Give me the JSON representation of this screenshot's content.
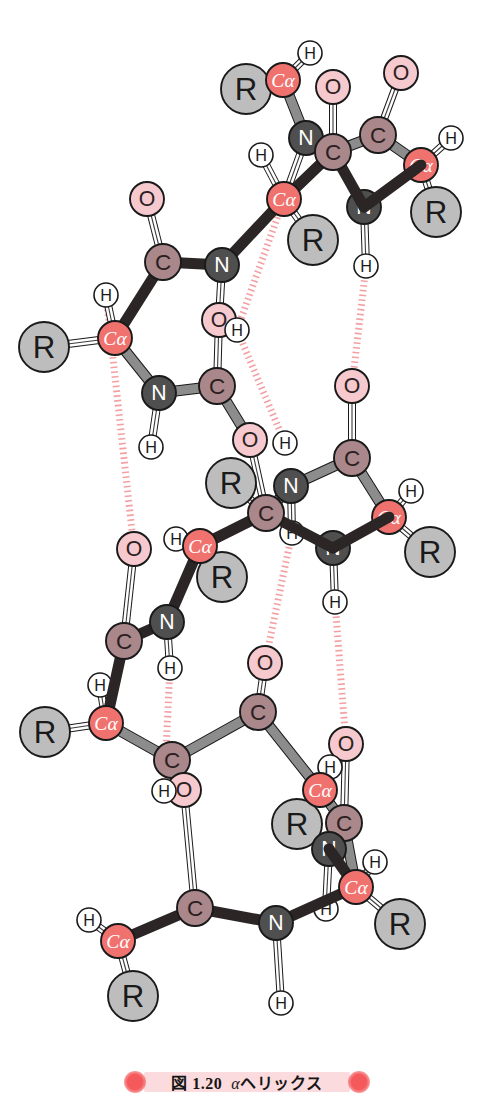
{
  "figure": {
    "caption_number": "図 1.20",
    "caption_alpha": "α",
    "caption_title": "ヘリックス",
    "caption_full": "図 1.20  αヘリックス",
    "background_color": "#ffffff"
  },
  "legend_colors": {
    "c_alpha": "#f0726f",
    "c_alpha_text": "#ffffff",
    "carbon": "#a9878a",
    "carbon_text": "#2b2020",
    "nitrogen": "#4f4f4f",
    "nitrogen_text": "#ffffff",
    "oxygen": "#f5c9cd",
    "oxygen_text": "#2b2020",
    "r_group": "#bdbdbd",
    "r_group_text": "#1a1a1a",
    "hydrogen": "#ffffff",
    "hydrogen_text": "#1a1a1a",
    "bond_front": "#2b2526",
    "bond_back": "#8c8c8c",
    "bond_double": "#ffffff",
    "hbond": "#f4a0a3",
    "outline": "#1a1a1a"
  },
  "atom_labels": {
    "c_alpha": "Cα",
    "carbon": "C",
    "nitrogen": "N",
    "oxygen": "O",
    "r_group": "R",
    "hydrogen": "H"
  },
  "atoms": [
    {
      "id": "a1",
      "label": "R",
      "kind": "r",
      "x": 246,
      "y": 89,
      "r": 25,
      "depth": 1
    },
    {
      "id": "a2",
      "label": "Cα",
      "kind": "ca",
      "x": 283,
      "y": 80,
      "r": 17,
      "depth": 2
    },
    {
      "id": "a3",
      "label": "H",
      "kind": "h",
      "x": 310,
      "y": 53,
      "r": 12,
      "depth": 1
    },
    {
      "id": "a4",
      "label": "O",
      "kind": "o",
      "x": 333,
      "y": 87,
      "r": 17,
      "depth": 1
    },
    {
      "id": "a5",
      "label": "O",
      "kind": "o",
      "x": 401,
      "y": 73,
      "r": 17,
      "depth": 1
    },
    {
      "id": "a6",
      "label": "N",
      "kind": "n",
      "x": 306,
      "y": 138,
      "r": 17,
      "depth": 1
    },
    {
      "id": "a7",
      "label": "C",
      "kind": "c",
      "x": 333,
      "y": 152,
      "r": 18,
      "depth": 2
    },
    {
      "id": "a8",
      "label": "C",
      "kind": "c",
      "x": 378,
      "y": 135,
      "r": 18,
      "depth": 1
    },
    {
      "id": "a9",
      "label": "H",
      "kind": "h",
      "x": 451,
      "y": 138,
      "r": 12,
      "depth": 1
    },
    {
      "id": "a10",
      "label": "Cα",
      "kind": "ca",
      "x": 421,
      "y": 165,
      "r": 17,
      "depth": 1
    },
    {
      "id": "a11",
      "label": "R",
      "kind": "r",
      "x": 436,
      "y": 212,
      "r": 25,
      "depth": 1
    },
    {
      "id": "a12",
      "label": "H",
      "kind": "h",
      "x": 261,
      "y": 155,
      "r": 12,
      "depth": 1
    },
    {
      "id": "a13",
      "label": "Cα",
      "kind": "ca",
      "x": 284,
      "y": 199,
      "r": 17,
      "depth": 2
    },
    {
      "id": "a14",
      "label": "R",
      "kind": "r",
      "x": 313,
      "y": 240,
      "r": 25,
      "depth": 1
    },
    {
      "id": "a15",
      "label": "N",
      "kind": "n",
      "x": 364,
      "y": 207,
      "r": 17,
      "depth": 1
    },
    {
      "id": "a16",
      "label": "H",
      "kind": "h",
      "x": 366,
      "y": 266,
      "r": 12,
      "depth": 1
    },
    {
      "id": "a17",
      "label": "O",
      "kind": "o",
      "x": 147,
      "y": 199,
      "r": 17,
      "depth": 1
    },
    {
      "id": "a18",
      "label": "C",
      "kind": "c",
      "x": 163,
      "y": 262,
      "r": 18,
      "depth": 2
    },
    {
      "id": "a19",
      "label": "N",
      "kind": "n",
      "x": 222,
      "y": 265,
      "r": 17,
      "depth": 2
    },
    {
      "id": "a20",
      "label": "H",
      "kind": "h",
      "x": 106,
      "y": 295,
      "r": 12,
      "depth": 1
    },
    {
      "id": "a21",
      "label": "Cα",
      "kind": "ca",
      "x": 115,
      "y": 338,
      "r": 17,
      "depth": 2
    },
    {
      "id": "a22",
      "label": "R",
      "kind": "r",
      "x": 44,
      "y": 347,
      "r": 25,
      "depth": 1
    },
    {
      "id": "a23",
      "label": "N",
      "kind": "n",
      "x": 159,
      "y": 393,
      "r": 17,
      "depth": 1
    },
    {
      "id": "a24",
      "label": "H",
      "kind": "h",
      "x": 151,
      "y": 447,
      "r": 12,
      "depth": 1
    },
    {
      "id": "a25",
      "label": "O",
      "kind": "o",
      "x": 219,
      "y": 320,
      "r": 17,
      "depth": 1
    },
    {
      "id": "a26",
      "label": "H",
      "kind": "h",
      "x": 237,
      "y": 330,
      "r": 12,
      "depth": 1
    },
    {
      "id": "a27",
      "label": "C",
      "kind": "c",
      "x": 217,
      "y": 386,
      "r": 18,
      "depth": 1
    },
    {
      "id": "a28",
      "label": "O",
      "kind": "o",
      "x": 250,
      "y": 440,
      "r": 17,
      "depth": 1
    },
    {
      "id": "a29",
      "label": "H",
      "kind": "h",
      "x": 285,
      "y": 443,
      "r": 12,
      "depth": 1
    },
    {
      "id": "a30",
      "label": "O",
      "kind": "o",
      "x": 352,
      "y": 386,
      "r": 17,
      "depth": 1
    },
    {
      "id": "a31",
      "label": "R",
      "kind": "r",
      "x": 231,
      "y": 483,
      "r": 25,
      "depth": 1
    },
    {
      "id": "a32",
      "label": "C",
      "kind": "c",
      "x": 266,
      "y": 513,
      "r": 18,
      "depth": 2
    },
    {
      "id": "a33",
      "label": "N",
      "kind": "n",
      "x": 291,
      "y": 486,
      "r": 17,
      "depth": 1
    },
    {
      "id": "a34",
      "label": "H",
      "kind": "h",
      "x": 292,
      "y": 533,
      "r": 12,
      "depth": 1
    },
    {
      "id": "a35",
      "label": "C",
      "kind": "c",
      "x": 352,
      "y": 458,
      "r": 18,
      "depth": 1
    },
    {
      "id": "a36",
      "label": "H",
      "kind": "h",
      "x": 411,
      "y": 491,
      "r": 12,
      "depth": 1
    },
    {
      "id": "a37",
      "label": "Cα",
      "kind": "ca",
      "x": 389,
      "y": 517,
      "r": 17,
      "depth": 1
    },
    {
      "id": "a38",
      "label": "R",
      "kind": "r",
      "x": 430,
      "y": 552,
      "r": 25,
      "depth": 1
    },
    {
      "id": "a39",
      "label": "N",
      "kind": "n",
      "x": 333,
      "y": 548,
      "r": 17,
      "depth": 1
    },
    {
      "id": "a40",
      "label": "H",
      "kind": "h",
      "x": 335,
      "y": 602,
      "r": 12,
      "depth": 1
    },
    {
      "id": "a41",
      "label": "H",
      "kind": "h",
      "x": 176,
      "y": 539,
      "r": 12,
      "depth": 1
    },
    {
      "id": "a42",
      "label": "Cα",
      "kind": "ca",
      "x": 200,
      "y": 546,
      "r": 17,
      "depth": 2
    },
    {
      "id": "a43",
      "label": "R",
      "kind": "r",
      "x": 222,
      "y": 577,
      "r": 25,
      "depth": 1
    },
    {
      "id": "a44",
      "label": "O",
      "kind": "o",
      "x": 134,
      "y": 549,
      "r": 17,
      "depth": 1
    },
    {
      "id": "a45",
      "label": "N",
      "kind": "n",
      "x": 167,
      "y": 622,
      "r": 17,
      "depth": 2
    },
    {
      "id": "a46",
      "label": "H",
      "kind": "h",
      "x": 170,
      "y": 668,
      "r": 12,
      "depth": 1
    },
    {
      "id": "a47",
      "label": "C",
      "kind": "c",
      "x": 124,
      "y": 641,
      "r": 18,
      "depth": 2
    },
    {
      "id": "a48",
      "label": "H",
      "kind": "h",
      "x": 100,
      "y": 685,
      "r": 12,
      "depth": 1
    },
    {
      "id": "a49",
      "label": "Cα",
      "kind": "ca",
      "x": 106,
      "y": 723,
      "r": 17,
      "depth": 2
    },
    {
      "id": "a50",
      "label": "R",
      "kind": "r",
      "x": 45,
      "y": 732,
      "r": 25,
      "depth": 1
    },
    {
      "id": "a51",
      "label": "C",
      "kind": "c",
      "x": 172,
      "y": 760,
      "r": 18,
      "depth": 1
    },
    {
      "id": "a52",
      "label": "O",
      "kind": "o",
      "x": 265,
      "y": 663,
      "r": 17,
      "depth": 1
    },
    {
      "id": "a53",
      "label": "C",
      "kind": "c",
      "x": 258,
      "y": 712,
      "r": 18,
      "depth": 1
    },
    {
      "id": "a54",
      "label": "O",
      "kind": "o",
      "x": 184,
      "y": 790,
      "r": 17,
      "depth": 1
    },
    {
      "id": "a55",
      "label": "H",
      "kind": "h",
      "x": 164,
      "y": 791,
      "r": 12,
      "depth": 1
    },
    {
      "id": "a56",
      "label": "O",
      "kind": "o",
      "x": 346,
      "y": 744,
      "r": 17,
      "depth": 1
    },
    {
      "id": "a57",
      "label": "H",
      "kind": "h",
      "x": 330,
      "y": 767,
      "r": 12,
      "depth": 1
    },
    {
      "id": "a58",
      "label": "Cα",
      "kind": "ca",
      "x": 320,
      "y": 790,
      "r": 17,
      "depth": 2
    },
    {
      "id": "a59",
      "label": "R",
      "kind": "r",
      "x": 297,
      "y": 824,
      "r": 25,
      "depth": 1
    },
    {
      "id": "a60",
      "label": "C",
      "kind": "c",
      "x": 344,
      "y": 823,
      "r": 18,
      "depth": 1
    },
    {
      "id": "a61",
      "label": "N",
      "kind": "n",
      "x": 329,
      "y": 849,
      "r": 17,
      "depth": 1
    },
    {
      "id": "a62",
      "label": "H",
      "kind": "h",
      "x": 375,
      "y": 862,
      "r": 12,
      "depth": 1
    },
    {
      "id": "a63",
      "label": "Cα",
      "kind": "ca",
      "x": 356,
      "y": 887,
      "r": 17,
      "depth": 2
    },
    {
      "id": "a64",
      "label": "R",
      "kind": "r",
      "x": 400,
      "y": 924,
      "r": 25,
      "depth": 1
    },
    {
      "id": "a65",
      "label": "H",
      "kind": "h",
      "x": 326,
      "y": 909,
      "r": 12,
      "depth": 1
    },
    {
      "id": "a66",
      "label": "C",
      "kind": "c",
      "x": 195,
      "y": 908,
      "r": 18,
      "depth": 2
    },
    {
      "id": "a67",
      "label": "N",
      "kind": "n",
      "x": 276,
      "y": 923,
      "r": 17,
      "depth": 2
    },
    {
      "id": "a68",
      "label": "H",
      "kind": "h",
      "x": 281,
      "y": 1003,
      "r": 12,
      "depth": 1
    },
    {
      "id": "a69",
      "label": "H",
      "kind": "h",
      "x": 89,
      "y": 920,
      "r": 12,
      "depth": 1
    },
    {
      "id": "a70",
      "label": "Cα",
      "kind": "ca",
      "x": 118,
      "y": 941,
      "r": 17,
      "depth": 2
    },
    {
      "id": "a71",
      "label": "R",
      "kind": "r",
      "x": 133,
      "y": 996,
      "r": 25,
      "depth": 1
    }
  ],
  "bonds": [
    {
      "from": "a1",
      "to": "a2",
      "style": "double"
    },
    {
      "from": "a2",
      "to": "a3",
      "style": "double"
    },
    {
      "from": "a2",
      "to": "a6",
      "style": "back"
    },
    {
      "from": "a6",
      "to": "a7",
      "style": "back"
    },
    {
      "from": "a4",
      "to": "a7",
      "style": "double"
    },
    {
      "from": "a7",
      "to": "a8",
      "style": "back"
    },
    {
      "from": "a5",
      "to": "a8",
      "style": "double"
    },
    {
      "from": "a8",
      "to": "a10",
      "style": "back"
    },
    {
      "from": "a10",
      "to": "a9",
      "style": "double"
    },
    {
      "from": "a10",
      "to": "a11",
      "style": "double"
    },
    {
      "from": "a10",
      "to": "a15",
      "style": "front"
    },
    {
      "from": "a15",
      "to": "a7",
      "style": "front"
    },
    {
      "from": "a15",
      "to": "a16",
      "style": "double"
    },
    {
      "from": "a7",
      "to": "a13",
      "style": "front"
    },
    {
      "from": "a13",
      "to": "a12",
      "style": "double"
    },
    {
      "from": "a13",
      "to": "a6",
      "style": "double"
    },
    {
      "from": "a13",
      "to": "a14",
      "style": "double"
    },
    {
      "from": "a13",
      "to": "a19",
      "style": "front"
    },
    {
      "from": "a19",
      "to": "a18",
      "style": "front"
    },
    {
      "from": "a18",
      "to": "a17",
      "style": "double"
    },
    {
      "from": "a18",
      "to": "a21",
      "style": "front"
    },
    {
      "from": "a21",
      "to": "a20",
      "style": "double"
    },
    {
      "from": "a21",
      "to": "a22",
      "style": "double"
    },
    {
      "from": "a21",
      "to": "a23",
      "style": "back"
    },
    {
      "from": "a23",
      "to": "a24",
      "style": "double"
    },
    {
      "from": "a23",
      "to": "a27",
      "style": "back"
    },
    {
      "from": "a19",
      "to": "a25",
      "style": "double"
    },
    {
      "from": "a27",
      "to": "a25",
      "style": "double"
    },
    {
      "from": "a27",
      "to": "a28",
      "style": "back"
    },
    {
      "from": "a28",
      "to": "a32",
      "style": "double"
    },
    {
      "from": "a32",
      "to": "a31",
      "style": "double"
    },
    {
      "from": "a32",
      "to": "a33",
      "style": "back"
    },
    {
      "from": "a33",
      "to": "a34",
      "style": "double"
    },
    {
      "from": "a33",
      "to": "a35",
      "style": "back"
    },
    {
      "from": "a35",
      "to": "a30",
      "style": "double"
    },
    {
      "from": "a35",
      "to": "a37",
      "style": "back"
    },
    {
      "from": "a37",
      "to": "a36",
      "style": "double"
    },
    {
      "from": "a37",
      "to": "a38",
      "style": "double"
    },
    {
      "from": "a37",
      "to": "a39",
      "style": "front"
    },
    {
      "from": "a39",
      "to": "a32",
      "style": "front"
    },
    {
      "from": "a39",
      "to": "a40",
      "style": "double"
    },
    {
      "from": "a32",
      "to": "a42",
      "style": "front"
    },
    {
      "from": "a42",
      "to": "a41",
      "style": "double"
    },
    {
      "from": "a42",
      "to": "a43",
      "style": "double"
    },
    {
      "from": "a42",
      "to": "a45",
      "style": "front"
    },
    {
      "from": "a45",
      "to": "a46",
      "style": "double"
    },
    {
      "from": "a45",
      "to": "a47",
      "style": "front"
    },
    {
      "from": "a47",
      "to": "a44",
      "style": "double"
    },
    {
      "from": "a47",
      "to": "a49",
      "style": "front"
    },
    {
      "from": "a49",
      "to": "a48",
      "style": "double"
    },
    {
      "from": "a49",
      "to": "a50",
      "style": "double"
    },
    {
      "from": "a49",
      "to": "a51",
      "style": "back"
    },
    {
      "from": "a51",
      "to": "a53",
      "style": "back"
    },
    {
      "from": "a53",
      "to": "a52",
      "style": "double"
    },
    {
      "from": "a53",
      "to": "a58",
      "style": "back"
    },
    {
      "from": "a51",
      "to": "a54",
      "style": "double"
    },
    {
      "from": "a54",
      "to": "a55",
      "style": "double"
    },
    {
      "from": "a54",
      "to": "a66",
      "style": "double"
    },
    {
      "from": "a58",
      "to": "a57",
      "style": "double"
    },
    {
      "from": "a58",
      "to": "a59",
      "style": "double"
    },
    {
      "from": "a58",
      "to": "a60",
      "style": "back"
    },
    {
      "from": "a60",
      "to": "a56",
      "style": "double"
    },
    {
      "from": "a60",
      "to": "a63",
      "style": "back"
    },
    {
      "from": "a61",
      "to": "a63",
      "style": "front"
    },
    {
      "from": "a61",
      "to": "a65",
      "style": "double"
    },
    {
      "from": "a63",
      "to": "a62",
      "style": "double"
    },
    {
      "from": "a63",
      "to": "a64",
      "style": "double"
    },
    {
      "from": "a63",
      "to": "a67",
      "style": "front"
    },
    {
      "from": "a67",
      "to": "a66",
      "style": "front"
    },
    {
      "from": "a67",
      "to": "a68",
      "style": "double"
    },
    {
      "from": "a66",
      "to": "a70",
      "style": "front"
    },
    {
      "from": "a70",
      "to": "a69",
      "style": "double"
    },
    {
      "from": "a70",
      "to": "a71",
      "style": "double"
    }
  ],
  "hydrogen_bonds": [
    {
      "from": "a13",
      "to": "a26"
    },
    {
      "from": "a16",
      "to": "a30"
    },
    {
      "from": "a26",
      "to": "a29"
    },
    {
      "from": "a20",
      "to": "a44"
    },
    {
      "from": "a34",
      "to": "a52"
    },
    {
      "from": "a40",
      "to": "a56"
    },
    {
      "from": "a46",
      "to": "a55"
    }
  ]
}
